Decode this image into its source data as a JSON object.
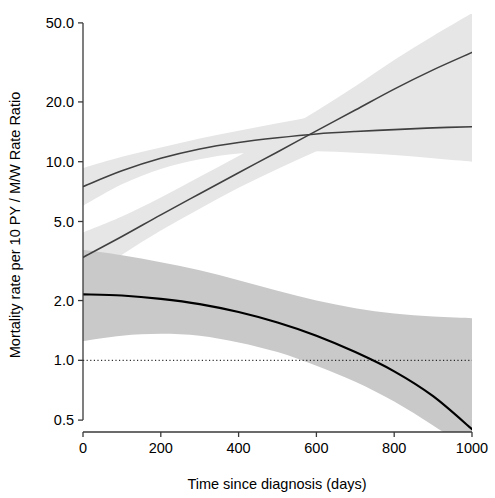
{
  "chart_data": {
    "type": "line",
    "title": "",
    "subtitle": "",
    "xlabel": "Time since diagnosis (days)",
    "ylabel": "Mortality rate per 10 PY / M/W Rate Ratio",
    "xlim": [
      0,
      1000
    ],
    "ylim": [
      0.5,
      50.0
    ],
    "yscale": "log",
    "xscale": "linear",
    "grid": false,
    "legend": null,
    "xticks": [
      0,
      200,
      400,
      600,
      800,
      1000
    ],
    "xtick_labels": [
      "0",
      "200",
      "400",
      "600",
      "800",
      "1000"
    ],
    "yticks": [
      0.5,
      1.0,
      2.0,
      5.0,
      10.0,
      20.0,
      50.0
    ],
    "ytick_labels": [
      "0.5",
      "1.0",
      "2.0",
      "5.0",
      "10.0",
      "20.0",
      "50.0"
    ],
    "reference_line": {
      "y": 1.0,
      "style": "dotted",
      "color": "#000000"
    },
    "x": [
      0,
      100,
      200,
      300,
      400,
      500,
      600,
      700,
      800,
      900,
      1000
    ],
    "series": [
      {
        "name": "Men mortality rate per 10 PY",
        "role": "upper-curve",
        "color": "#404040",
        "linewidth": 1.6,
        "values": [
          7.5,
          9.0,
          10.4,
          11.6,
          12.5,
          13.2,
          13.8,
          14.2,
          14.5,
          14.8,
          15.0
        ],
        "band": {
          "fill": "#e6e6e6",
          "opacity": 1,
          "lower": [
            6.0,
            7.7,
            9.2,
            10.3,
            11.0,
            11.3,
            11.3,
            11.1,
            10.8,
            10.4,
            10.0
          ],
          "upper": [
            9.3,
            10.6,
            11.8,
            13.1,
            14.3,
            15.6,
            17.0,
            18.5,
            20.0,
            21.5,
            23.0
          ]
        }
      },
      {
        "name": "Women mortality rate per 10 PY",
        "role": "middle-curve",
        "color": "#404040",
        "linewidth": 1.6,
        "values": [
          3.3,
          4.2,
          5.4,
          6.9,
          8.8,
          11.2,
          14.3,
          18.2,
          23.2,
          29.0,
          35.5
        ],
        "band": {
          "fill": "#e6e6e6",
          "opacity": 1,
          "lower": [
            2.5,
            3.4,
            4.5,
            5.8,
            7.4,
            9.2,
            11.3,
            13.7,
            16.4,
            19.3,
            22.5
          ],
          "upper": [
            4.4,
            5.3,
            6.6,
            8.4,
            10.7,
            13.8,
            18.0,
            24.0,
            32.5,
            43.0,
            56.0
          ]
        }
      },
      {
        "name": "M/W Rate Ratio",
        "role": "ratio-curve",
        "color": "#000000",
        "linewidth": 2.2,
        "values": [
          2.15,
          2.12,
          2.04,
          1.92,
          1.75,
          1.55,
          1.33,
          1.1,
          0.88,
          0.66,
          0.45
        ],
        "band": {
          "fill": "#c9c9c9",
          "opacity": 1,
          "lower": [
            1.25,
            1.33,
            1.36,
            1.33,
            1.23,
            1.1,
            0.94,
            0.78,
            0.62,
            0.47,
            0.35
          ],
          "upper": [
            3.6,
            3.38,
            3.12,
            2.84,
            2.53,
            2.24,
            2.0,
            1.83,
            1.72,
            1.66,
            1.63
          ]
        }
      }
    ],
    "annotations": []
  }
}
